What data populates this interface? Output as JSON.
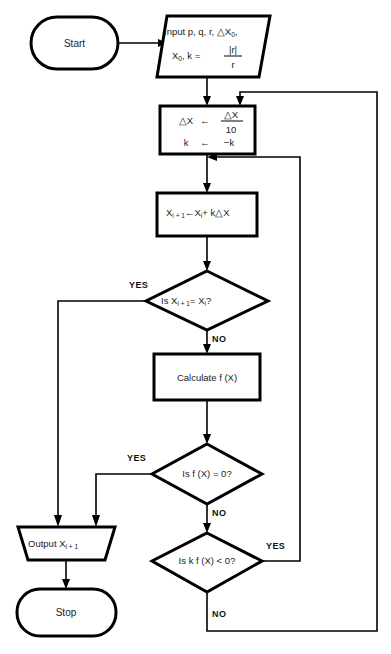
{
  "diagram": {
    "background_color": "#ffffff",
    "line_color": "#000000",
    "text_color": "#1a1a1a"
  },
  "nodes": {
    "start": {
      "type": "terminator",
      "label": "Start"
    },
    "input": {
      "type": "input-trapezoid",
      "line1": "Input p, q, r, △X",
      "line1_sub": "0",
      "line1_tail": ",",
      "line2_a": "X",
      "line2_a_sub": "0",
      "line2_b": ", k =",
      "numerator": "|r|",
      "denominator": "r"
    },
    "delta_step": {
      "type": "process",
      "row1_left": "△X",
      "row1_arrow": "←",
      "row1_numerator": "△X",
      "row1_denominator": "10",
      "row2_left": "k",
      "row2_arrow": "←",
      "row2_right": "−k"
    },
    "increment": {
      "type": "process",
      "a": "X",
      "a_sub": "i + 1",
      "arrow": "←",
      "b": "X",
      "b_sub": "i",
      "c": "+ k△X"
    },
    "decision_converged": {
      "type": "decision",
      "a": "Is X",
      "a_sub": "i + 1",
      "b": "= X",
      "b_sub": "i",
      "c": "?",
      "yes_label": "YES",
      "no_label": "NO"
    },
    "calculate": {
      "type": "process",
      "label": "Calculate f (X)"
    },
    "decision_zero": {
      "type": "decision",
      "label": "Is f (X) = 0?",
      "yes_label": "YES",
      "no_label": "NO"
    },
    "decision_sign": {
      "type": "decision",
      "label": "Is k f (X) < 0?",
      "yes_label": "YES",
      "no_label": "NO"
    },
    "output": {
      "type": "output-trapezoid",
      "label": "Output X",
      "label_sub": "i + 1"
    },
    "stop": {
      "type": "terminator",
      "label": "Stop"
    }
  }
}
